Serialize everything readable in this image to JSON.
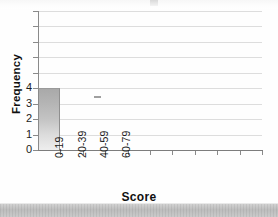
{
  "chart_data": {
    "type": "bar",
    "title": "",
    "xlabel": "Score",
    "ylabel": "Frequency",
    "categories": [
      "0-19",
      "20-39",
      "40-59",
      "60-79",
      "",
      "",
      "",
      "",
      "",
      ""
    ],
    "values": [
      4,
      0,
      0,
      0,
      0,
      0,
      0,
      0,
      0,
      0
    ],
    "visible_tick_labels": [
      "0-19",
      "20-39",
      "40-59",
      "60-79"
    ],
    "y_tick_labels": [
      "0",
      "1",
      "2",
      "3",
      "4"
    ],
    "ylim": [
      0,
      9
    ],
    "xlim": [
      0,
      10
    ],
    "y_gridline_values": [
      1,
      2,
      3,
      4,
      5,
      6,
      7,
      8,
      9
    ],
    "grid": "horizontal",
    "legend": "none",
    "bar_color": "#c0c0c0",
    "grid_color": "#dddddd",
    "axis_color": "#8a8a8a",
    "text_color": "#1c1c1c"
  },
  "axes": {
    "y_title": "Frequency",
    "x_title": "Score"
  },
  "artifacts": {
    "note": "scanned page with cropped title and gray page-edge strip"
  }
}
